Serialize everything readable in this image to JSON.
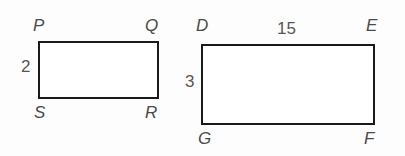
{
  "figure": {
    "background_color": "#fdfdfd",
    "stroke_color": "#1a1a1a",
    "label_color": "#4a4a4a",
    "measure_color": "#555555",
    "shapes": [
      {
        "name": "rectangle-pqrs",
        "vertices": [
          "P",
          "Q",
          "R",
          "S"
        ],
        "x": 38,
        "y": 41,
        "width": 121,
        "height": 58
      },
      {
        "name": "rectangle-defg",
        "vertices": [
          "D",
          "E",
          "F",
          "G"
        ],
        "x": 201,
        "y": 44,
        "width": 174,
        "height": 81
      }
    ],
    "left_rectangle": {
      "vertex_top_left": "P",
      "vertex_top_right": "Q",
      "vertex_bottom_left": "S",
      "vertex_bottom_right": "R",
      "left_side_length": "2"
    },
    "right_rectangle": {
      "vertex_top_left": "D",
      "vertex_top_right": "E",
      "vertex_bottom_left": "G",
      "vertex_bottom_right": "F",
      "top_side_length": "15",
      "left_side_length": "3"
    }
  }
}
